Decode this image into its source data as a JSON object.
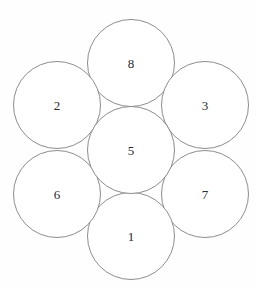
{
  "diagram": {
    "type": "circle-rosette",
    "background_color": "#fefefe",
    "stroke_color": "#8d8d8d",
    "fill_color": "#ffffff",
    "label_color": "#2a2a2a",
    "circle_diameter": 87,
    "circle_radius": 43.5,
    "petal_orbit_radius": 49,
    "center_point": {
      "x": 131,
      "y": 150
    },
    "canvas": {
      "width": 257,
      "height": 290
    },
    "circles": [
      {
        "id": "circle-center",
        "label": "5",
        "position": "center",
        "cx": 131,
        "cy": 150,
        "r": 43.5
      },
      {
        "id": "circle-top",
        "label": "8",
        "position": "top",
        "cx": 131,
        "cy": 63,
        "r": 43.5
      },
      {
        "id": "circle-upper-right",
        "label": "3",
        "position": "upper-right",
        "cx": 205,
        "cy": 105,
        "r": 43.5
      },
      {
        "id": "circle-lower-right",
        "label": "7",
        "position": "lower-right",
        "cx": 205,
        "cy": 194,
        "r": 43.5
      },
      {
        "id": "circle-bottom",
        "label": "1",
        "position": "bottom",
        "cx": 131,
        "cy": 236,
        "r": 43.5
      },
      {
        "id": "circle-lower-left",
        "label": "6",
        "position": "lower-left",
        "cx": 57,
        "cy": 194,
        "r": 43.5
      },
      {
        "id": "circle-upper-left",
        "label": "2",
        "position": "upper-left",
        "cx": 57,
        "cy": 105,
        "r": 43.5
      }
    ]
  }
}
